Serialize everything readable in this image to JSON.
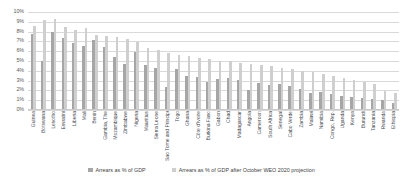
{
  "chart_data": {
    "type": "bar",
    "title": "",
    "subtitle": "",
    "xlabel": "",
    "ylabel": "",
    "ylim": [
      0,
      10
    ],
    "ytick_labels": [
      "10%",
      "9%",
      "8%",
      "7%",
      "6%",
      "5%",
      "4%",
      "3%",
      "2%",
      "1%",
      "0%"
    ],
    "ytick_values": [
      10,
      9,
      8,
      7,
      6,
      5,
      4,
      3,
      2,
      1,
      0
    ],
    "grid": true,
    "legend_position": "bottom",
    "orientation": "vertical",
    "grouped": true,
    "categories": [
      "Guinea",
      "Botswana",
      "Lesotho",
      "Eswatini",
      "Liberia",
      "Mali",
      "Benin",
      "Gambia, The",
      "Mozambique",
      "Zimbabwe",
      "Nigeria",
      "Mauritius",
      "Sierra Leone",
      "Sao Tome and Principe",
      "Togo",
      "Ghana",
      "Côte d'Ivoire",
      "Burkina Faso",
      "Gabon",
      "Chad",
      "Madagascar",
      "Angola",
      "Cameroon",
      "South Africa",
      "Senegal",
      "Cabo Verde",
      "Zambia",
      "Malawi",
      "Namibia",
      "Congo, Rep.",
      "Uganda",
      "Kenya",
      "Burundi",
      "Tanzania",
      "Rwanda",
      "Ethiopia"
    ],
    "series": [
      {
        "name": "Arrears as % of GDP",
        "color": "#a6a6a6",
        "values": [
          7.7,
          5.0,
          7.9,
          7.3,
          6.8,
          6.5,
          7.1,
          6.4,
          5.4,
          4.6,
          5.9,
          4.5,
          4.2,
          2.3,
          4.1,
          3.4,
          3.3,
          2.8,
          3.1,
          3.2,
          3.0,
          2.0,
          2.7,
          2.5,
          2.6,
          2.4,
          2.1,
          1.6,
          1.8,
          1.5,
          1.3,
          1.2,
          1.1,
          1.0,
          0.9,
          0.6
        ]
      },
      {
        "name": "Arrears as % of GDP after October WEO 2020 projection",
        "color": "#cfcfcf",
        "values": [
          8.6,
          9.2,
          9.3,
          8.5,
          8.1,
          8.4,
          7.6,
          7.5,
          7.4,
          7.2,
          6.9,
          6.3,
          6.1,
          5.8,
          5.6,
          5.5,
          5.3,
          5.2,
          5.0,
          4.9,
          4.7,
          4.6,
          4.5,
          4.4,
          4.2,
          4.1,
          3.9,
          3.8,
          3.6,
          3.4,
          3.2,
          3.0,
          2.8,
          2.6,
          1.9,
          1.7
        ]
      }
    ]
  },
  "legend": {
    "items": [
      {
        "label": "Arrears as % of GDP"
      },
      {
        "label": "Arrears as % of GDP after October WEO 2020 projection"
      }
    ]
  },
  "colors": {
    "series_1": "#a6a6a6",
    "series_2": "#cfcfcf",
    "gridline": "#d9d9d9",
    "axis_text": "#5a5a5a",
    "background": "#ffffff"
  }
}
